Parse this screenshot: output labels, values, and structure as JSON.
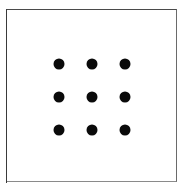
{
  "figure": {
    "canvas": {
      "width": 194,
      "height": 189,
      "background": "#ffffff"
    },
    "frame": {
      "name": "rectangular-border",
      "x": 6,
      "y": 9,
      "width": 171,
      "height": 173,
      "stroke_color": "#4a4a4a",
      "stroke_width": 1.5,
      "fill": "#ffffff"
    },
    "dot_appearance": {
      "shape": "circle",
      "diameter": 11,
      "color": "#0a0a0a"
    },
    "grid": {
      "rows": 3,
      "columns": 3,
      "count": 9,
      "column_centers_x": [
        59,
        92,
        125
      ],
      "row_centers_y": [
        64,
        97,
        130
      ],
      "column_spacing": 33,
      "row_spacing": 33
    },
    "dots": [
      {
        "id": "dot-r1-c1",
        "row": 1,
        "col": 1,
        "cx": 59,
        "cy": 64
      },
      {
        "id": "dot-r1-c2",
        "row": 1,
        "col": 2,
        "cx": 92,
        "cy": 64
      },
      {
        "id": "dot-r1-c3",
        "row": 1,
        "col": 3,
        "cx": 125,
        "cy": 64
      },
      {
        "id": "dot-r2-c1",
        "row": 2,
        "col": 1,
        "cx": 59,
        "cy": 97
      },
      {
        "id": "dot-r2-c2",
        "row": 2,
        "col": 2,
        "cx": 92,
        "cy": 97
      },
      {
        "id": "dot-r2-c3",
        "row": 2,
        "col": 3,
        "cx": 125,
        "cy": 97
      },
      {
        "id": "dot-r3-c1",
        "row": 3,
        "col": 1,
        "cx": 59,
        "cy": 130
      },
      {
        "id": "dot-r3-c2",
        "row": 3,
        "col": 2,
        "cx": 92,
        "cy": 130
      },
      {
        "id": "dot-r3-c3",
        "row": 3,
        "col": 3,
        "cx": 125,
        "cy": 130
      }
    ]
  }
}
